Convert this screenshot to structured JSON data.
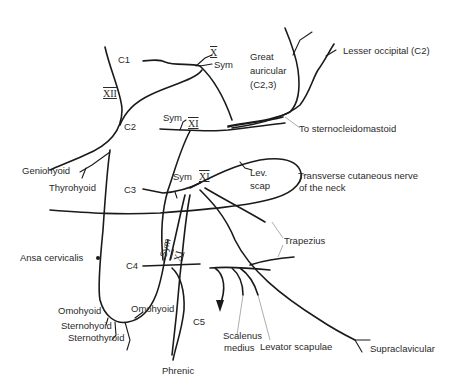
{
  "diagram": {
    "roots": [
      "C1",
      "C2",
      "C3",
      "C4",
      "C5"
    ],
    "cranial_nerves": [
      "X",
      "XI",
      "XII"
    ],
    "labels": {
      "c1": "C1",
      "c2": "C2",
      "c3": "C3",
      "c4": "C4",
      "c5": "C5",
      "x": "X",
      "xii": "XII",
      "xi_1": "XI",
      "xi_2": "XI",
      "xi_3": "XI",
      "sym_1": "Sym",
      "sym_2": "Sym",
      "sym_3": "Sym",
      "sym_4": "Sym",
      "great_auricular_1": "Great",
      "great_auricular_2": "auricular",
      "great_auricular_3": "(C2,3)",
      "lesser_occipital": "Lesser occipital (C2)",
      "sternocleidomastoid": "To sternocleidomastoid",
      "lev_scap_1": "Lev.",
      "lev_scap_2": "scap",
      "transverse_1": "Transverse cutaneous nerve",
      "transverse_2": "of the neck",
      "trapezius": "Trapezius",
      "geniohyoid": "Geniohyoid",
      "thyrohyoid": "Thyrohyoid",
      "ansa_cervicalis": "Ansa cervicalis",
      "omohyoid_left": "Omohyoid",
      "omohyoid_right": "Omohyoid",
      "sternohyoid": "Sternohyoid",
      "sternothyroid": "Sternothyroid",
      "phrenic": "Phrenic",
      "scalenus_1": "Scalenus",
      "scalenus_2": "medius",
      "levator_scapulae": "Levator scapulae",
      "supraclavicular": "Supraclavicular"
    },
    "colors": {
      "line": "#1a1a1a",
      "text": "#2a2a2a",
      "leader": "#8a8a8a",
      "background": "#ffffff"
    }
  }
}
